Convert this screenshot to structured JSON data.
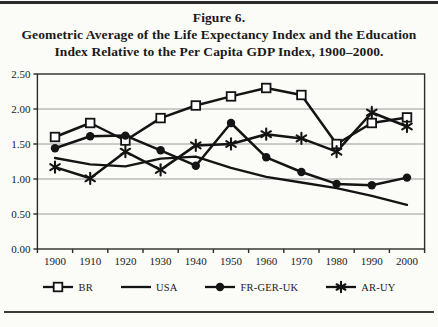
{
  "title": {
    "line1": "Figure 6.",
    "line2": "Geometric Average of the Life Expectancy Index and the Education",
    "line3": "Index Relative to the Per Capita GDP Index, 1900–2000."
  },
  "colors": {
    "ink": "#141414",
    "frame": "#2b2b2b",
    "grid": "#9a9a9a",
    "background": "#fbfbf8"
  },
  "chart_data": {
    "type": "line",
    "title": "Figure 6. Geometric Average of the Life Expectancy Index and the Education Index Relative to the Per Capita GDP Index, 1900–2000.",
    "x": [
      1900,
      1910,
      1920,
      1930,
      1940,
      1950,
      1960,
      1970,
      1980,
      1990,
      2000
    ],
    "xlabel": "",
    "ylabel": "",
    "ylim": [
      0,
      2.5
    ],
    "ytick_values": [
      0,
      0.5,
      1.0,
      1.5,
      2.0,
      2.5
    ],
    "ytick_labels": [
      "0.00",
      "0.50",
      "1.00",
      "1.50",
      "2.00",
      "2.50"
    ],
    "grid": "horizontal",
    "legend_position": "bottom",
    "series": [
      {
        "name": "BR",
        "marker": "square-open",
        "values": [
          1.6,
          1.8,
          1.55,
          1.87,
          2.05,
          2.18,
          2.3,
          2.2,
          1.5,
          1.8,
          1.88
        ]
      },
      {
        "name": "USA",
        "marker": "none",
        "values": [
          1.3,
          1.21,
          1.18,
          1.29,
          1.32,
          1.16,
          1.03,
          0.95,
          0.87,
          0.76,
          0.63
        ]
      },
      {
        "name": "FR-GER-UK",
        "marker": "circle-filled",
        "values": [
          1.44,
          1.61,
          1.62,
          1.41,
          1.19,
          1.8,
          1.31,
          1.1,
          0.93,
          0.91,
          1.02
        ]
      },
      {
        "name": "AR-UY",
        "marker": "asterisk",
        "values": [
          1.17,
          1.01,
          1.39,
          1.13,
          1.48,
          1.5,
          1.64,
          1.58,
          1.39,
          1.95,
          1.75
        ]
      }
    ]
  }
}
